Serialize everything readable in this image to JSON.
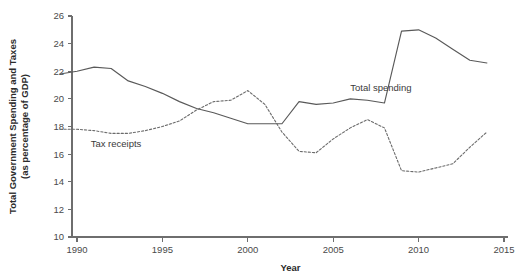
{
  "chart_data": {
    "type": "line",
    "title": "",
    "xlabel": "Year",
    "ylabel": "Total Government Spending and Taxes (as percentage of GDP)",
    "ylabel_line1": "Total Government Spending and Taxes",
    "ylabel_line2": "(as percentage of GDP)",
    "xlim": [
      1989,
      2015
    ],
    "ylim": [
      10,
      26
    ],
    "xticks": [
      1990,
      1995,
      2000,
      2005,
      2010,
      2015
    ],
    "xtick_labels": [
      "1990",
      "1995",
      "2000",
      "2005",
      "2010",
      "2015"
    ],
    "yticks": [
      10,
      12,
      14,
      16,
      18,
      20,
      22,
      24,
      26
    ],
    "ytick_labels": [
      "10",
      "12",
      "14",
      "16",
      "18",
      "20",
      "22",
      "24",
      "26"
    ],
    "grid": false,
    "legend_position": "inline-annotation",
    "x": [
      1989,
      1990,
      1991,
      1992,
      1993,
      1994,
      1995,
      1996,
      1997,
      1998,
      1999,
      2000,
      2001,
      2002,
      2003,
      2004,
      2005,
      2006,
      2007,
      2008,
      2009,
      2010,
      2011,
      2012,
      2013,
      2014
    ],
    "series": [
      {
        "name": "Total spending",
        "style": "solid",
        "color": "#595959",
        "annotation": "Total spending",
        "values": [
          21.8,
          22.0,
          22.3,
          22.2,
          21.3,
          20.9,
          20.4,
          19.8,
          19.3,
          19.0,
          18.6,
          18.2,
          18.2,
          18.2,
          19.8,
          19.6,
          19.7,
          20.0,
          19.9,
          19.7,
          24.9,
          25.0,
          24.4,
          23.6,
          22.8,
          22.6
        ]
      },
      {
        "name": "Tax receipts",
        "style": "dashed",
        "color": "#6b6b6b",
        "annotation": "Tax receipts",
        "values": [
          17.8,
          17.8,
          17.7,
          17.5,
          17.5,
          17.7,
          18.0,
          18.4,
          19.2,
          19.8,
          19.9,
          20.6,
          19.6,
          17.6,
          16.2,
          16.1,
          17.1,
          17.9,
          18.5,
          17.9,
          14.8,
          14.7,
          15.0,
          15.3,
          16.5,
          17.6
        ]
      }
    ],
    "annotations": [
      {
        "text": "Total spending",
        "x": 2006.0,
        "y": 20.6
      },
      {
        "text": "Tax receipts",
        "x": 1990.8,
        "y": 16.5
      }
    ]
  }
}
